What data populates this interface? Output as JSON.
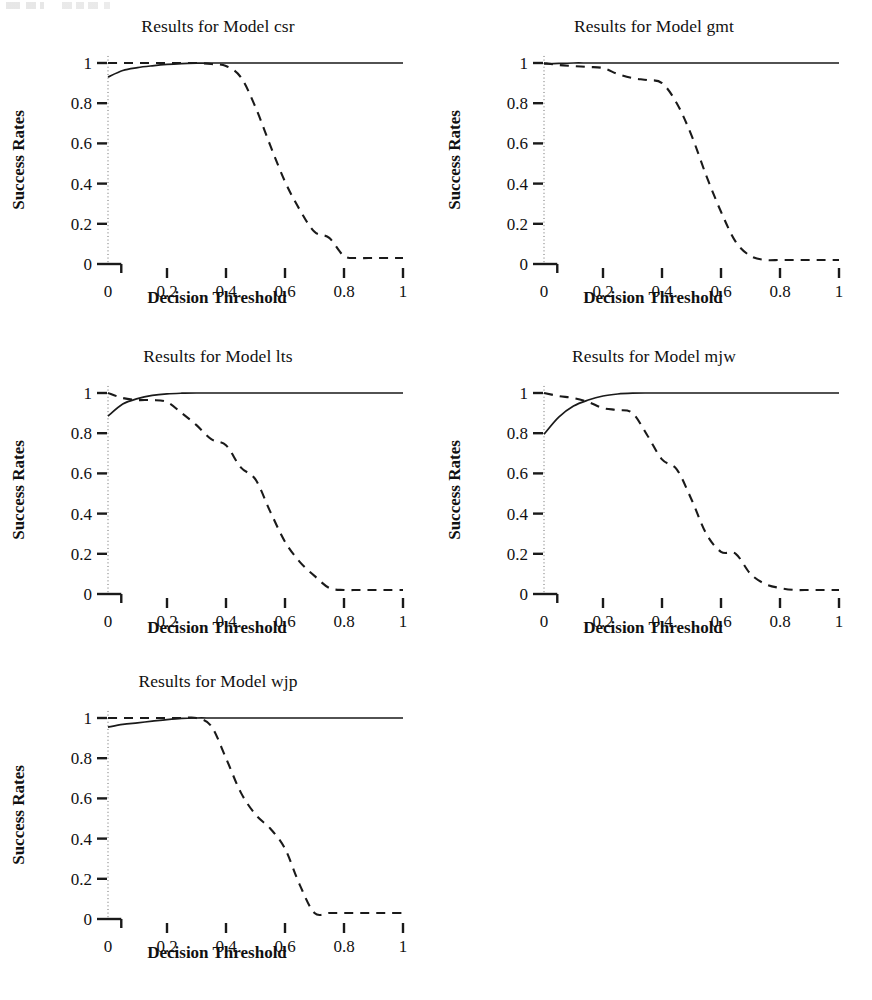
{
  "figure": {
    "axis_label_x": "Decision Threshold",
    "axis_label_y": "Success Rates",
    "x_tick_labels": [
      "0",
      "0.2",
      "0.4",
      "0.6",
      "0.8",
      "1"
    ],
    "y_tick_labels": [
      "0",
      "0.2",
      "0.4",
      "0.6",
      "0.8",
      "1"
    ],
    "line_color": "#1a1a1a"
  },
  "chart_data": [
    {
      "type": "line",
      "title": "Results for Model csr",
      "xlabel": "Decision Threshold",
      "ylabel": "Success Rates",
      "xlim": [
        0,
        1
      ],
      "ylim": [
        0,
        1
      ],
      "xticks": [
        0,
        0.2,
        0.4,
        0.6,
        0.8,
        1
      ],
      "yticks": [
        0,
        0.2,
        0.4,
        0.6,
        0.8,
        1
      ],
      "grid": false,
      "legend": "none",
      "x": [
        0,
        0.05,
        0.1,
        0.15,
        0.2,
        0.25,
        0.3,
        0.35,
        0.4,
        0.45,
        0.5,
        0.55,
        0.6,
        0.65,
        0.7,
        0.75,
        0.8,
        0.85,
        0.9,
        0.95,
        1
      ],
      "series": [
        {
          "name": "solid",
          "style": "solid",
          "values": [
            0.93,
            0.963,
            0.977,
            0.986,
            0.993,
            0.997,
            0.999,
            1.0,
            1.0,
            1.0,
            1.0,
            1.0,
            1.0,
            1.0,
            1.0,
            1.0,
            1.0,
            1.0,
            1.0,
            1.0,
            1.0
          ]
        },
        {
          "name": "dashed",
          "style": "dashed",
          "values": [
            1.0,
            1.0,
            1.0,
            1.0,
            1.0,
            1.0,
            1.0,
            0.995,
            0.985,
            0.93,
            0.78,
            0.59,
            0.41,
            0.27,
            0.16,
            0.13,
            0.04,
            0.03,
            0.03,
            0.03,
            0.03
          ]
        }
      ]
    },
    {
      "type": "line",
      "title": "Results for Model gmt",
      "xlabel": "Decision Threshold",
      "ylabel": "Success Rates",
      "xlim": [
        0,
        1
      ],
      "ylim": [
        0,
        1
      ],
      "xticks": [
        0,
        0.2,
        0.4,
        0.6,
        0.8,
        1
      ],
      "yticks": [
        0,
        0.2,
        0.4,
        0.6,
        0.8,
        1
      ],
      "grid": false,
      "legend": "none",
      "x": [
        0,
        0.05,
        0.1,
        0.15,
        0.2,
        0.25,
        0.3,
        0.35,
        0.4,
        0.45,
        0.5,
        0.55,
        0.6,
        0.65,
        0.7,
        0.75,
        0.8,
        0.85,
        0.9,
        0.95,
        1
      ],
      "series": [
        {
          "name": "solid",
          "style": "solid",
          "values": [
            0.995,
            0.998,
            1.0,
            1.0,
            1.0,
            1.0,
            1.0,
            1.0,
            1.0,
            1.0,
            1.0,
            1.0,
            1.0,
            1.0,
            1.0,
            1.0,
            1.0,
            1.0,
            1.0,
            1.0,
            1.0
          ]
        },
        {
          "name": "dashed",
          "style": "dashed",
          "values": [
            1.0,
            0.99,
            0.985,
            0.98,
            0.975,
            0.945,
            0.925,
            0.915,
            0.9,
            0.8,
            0.64,
            0.44,
            0.26,
            0.11,
            0.04,
            0.02,
            0.02,
            0.02,
            0.02,
            0.02,
            0.02
          ]
        }
      ]
    },
    {
      "type": "line",
      "title": "Results for Model lts",
      "xlabel": "Decision Threshold",
      "ylabel": "Success Rates",
      "xlim": [
        0,
        1
      ],
      "ylim": [
        0,
        1
      ],
      "xticks": [
        0,
        0.2,
        0.4,
        0.6,
        0.8,
        1
      ],
      "yticks": [
        0,
        0.2,
        0.4,
        0.6,
        0.8,
        1
      ],
      "grid": false,
      "legend": "none",
      "x": [
        0,
        0.05,
        0.1,
        0.15,
        0.2,
        0.25,
        0.3,
        0.35,
        0.4,
        0.45,
        0.5,
        0.55,
        0.6,
        0.65,
        0.7,
        0.75,
        0.8,
        0.85,
        0.9,
        0.95,
        1
      ],
      "series": [
        {
          "name": "solid",
          "style": "solid",
          "values": [
            0.885,
            0.945,
            0.972,
            0.988,
            0.996,
            0.999,
            1.0,
            1.0,
            1.0,
            1.0,
            1.0,
            1.0,
            1.0,
            1.0,
            1.0,
            1.0,
            1.0,
            1.0,
            1.0,
            1.0,
            1.0
          ]
        },
        {
          "name": "dashed",
          "style": "dashed",
          "values": [
            1.0,
            0.975,
            0.965,
            0.965,
            0.955,
            0.9,
            0.84,
            0.77,
            0.74,
            0.63,
            0.57,
            0.41,
            0.26,
            0.16,
            0.09,
            0.03,
            0.02,
            0.02,
            0.02,
            0.02,
            0.02
          ]
        }
      ]
    },
    {
      "type": "line",
      "title": "Results for Model mjw",
      "xlabel": "Decision Threshold",
      "ylabel": "Success Rates",
      "xlim": [
        0,
        1
      ],
      "ylim": [
        0,
        1
      ],
      "xticks": [
        0,
        0.2,
        0.4,
        0.6,
        0.8,
        1
      ],
      "yticks": [
        0,
        0.2,
        0.4,
        0.6,
        0.8,
        1
      ],
      "grid": false,
      "legend": "none",
      "x": [
        0,
        0.05,
        0.1,
        0.15,
        0.2,
        0.25,
        0.3,
        0.35,
        0.4,
        0.45,
        0.5,
        0.55,
        0.6,
        0.65,
        0.7,
        0.75,
        0.8,
        0.85,
        0.9,
        0.95,
        1
      ],
      "series": [
        {
          "name": "solid",
          "style": "solid",
          "values": [
            0.795,
            0.88,
            0.935,
            0.965,
            0.985,
            0.995,
            0.999,
            1.0,
            1.0,
            1.0,
            1.0,
            1.0,
            1.0,
            1.0,
            1.0,
            1.0,
            1.0,
            1.0,
            1.0,
            1.0,
            1.0
          ]
        },
        {
          "name": "dashed",
          "style": "dashed",
          "values": [
            1.0,
            0.985,
            0.975,
            0.955,
            0.925,
            0.915,
            0.9,
            0.79,
            0.67,
            0.62,
            0.47,
            0.3,
            0.21,
            0.2,
            0.1,
            0.05,
            0.03,
            0.02,
            0.02,
            0.02,
            0.02
          ]
        }
      ]
    },
    {
      "type": "line",
      "title": "Results for Model wjp",
      "xlabel": "Decision Threshold",
      "ylabel": "Success Rates",
      "xlim": [
        0,
        1
      ],
      "ylim": [
        0,
        1
      ],
      "xticks": [
        0,
        0.2,
        0.4,
        0.6,
        0.8,
        1
      ],
      "yticks": [
        0,
        0.2,
        0.4,
        0.6,
        0.8,
        1
      ],
      "grid": false,
      "legend": "none",
      "x": [
        0,
        0.05,
        0.1,
        0.15,
        0.2,
        0.25,
        0.3,
        0.35,
        0.4,
        0.45,
        0.5,
        0.55,
        0.6,
        0.65,
        0.7,
        0.75,
        0.8,
        0.85,
        0.9,
        0.95,
        1
      ],
      "series": [
        {
          "name": "solid",
          "style": "solid",
          "values": [
            0.955,
            0.968,
            0.976,
            0.984,
            0.992,
            0.998,
            1.0,
            1.0,
            1.0,
            1.0,
            1.0,
            1.0,
            1.0,
            1.0,
            1.0,
            1.0,
            1.0,
            1.0,
            1.0,
            1.0,
            1.0
          ]
        },
        {
          "name": "dashed",
          "style": "dashed",
          "values": [
            1.0,
            1.0,
            1.0,
            1.0,
            1.0,
            1.0,
            1.0,
            0.96,
            0.8,
            0.63,
            0.52,
            0.45,
            0.35,
            0.17,
            0.03,
            0.03,
            0.03,
            0.03,
            0.03,
            0.03,
            0.03
          ]
        }
      ]
    }
  ],
  "panels": [
    {
      "id": "csr",
      "title": "Results for Model csr"
    },
    {
      "id": "gmt",
      "title": "Results for Model gmt"
    },
    {
      "id": "lts",
      "title": "Results for Model lts"
    },
    {
      "id": "mjw",
      "title": "Results for Model mjw"
    },
    {
      "id": "wjp",
      "title": "Results for Model wjp"
    }
  ]
}
